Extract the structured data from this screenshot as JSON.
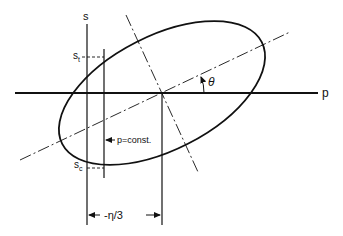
{
  "diagram": {
    "type": "yield-surface-ellipse",
    "colors": {
      "line": "#111111",
      "background": "#ffffff"
    },
    "axes": {
      "horizontal_label": "p",
      "vertical_label": "s"
    },
    "labels": {
      "s_t_main": "s",
      "s_t_sub": "t",
      "s_c_main": "s",
      "s_c_sub": "c",
      "angle": "θ",
      "const_line": "p=const.",
      "dimension": "-η/3",
      "dimension_arrow_left": "←",
      "dimension_arrow_right": "→"
    },
    "elements": [
      "ellipse",
      "major-axis (dash-dot)",
      "minor-axis (dash-dot)",
      "p-axis",
      "s-axis",
      "p=const line",
      "center vertical line",
      "s_t dashed marker",
      "s_c dashed marker",
      "angle arc θ",
      "dimension line -η/3"
    ]
  }
}
